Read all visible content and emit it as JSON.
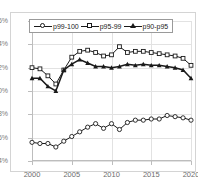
{
  "title": "",
  "chart_data": {
    "type": "line",
    "title": "",
    "xlabel": "",
    "ylabel": "",
    "xlim": [
      2000,
      2020
    ],
    "ylim": [
      4,
      16
    ],
    "ytick_labels": [
      "16%",
      "14%",
      "12%",
      "10%",
      "8%",
      "6%",
      "4%"
    ],
    "ytick_values": [
      16,
      14,
      12,
      10,
      8,
      6,
      4
    ],
    "xtick_labels": [
      "2000",
      "2005",
      "2010",
      "2015",
      "2020"
    ],
    "xtick_values": [
      2000,
      2005,
      2010,
      2015,
      2020
    ],
    "grid": true,
    "legend_position": "top-center",
    "value_suffix": "%",
    "x": [
      2000,
      2001,
      2002,
      2003,
      2004,
      2005,
      2006,
      2007,
      2008,
      2009,
      2010,
      2011,
      2012,
      2013,
      2014,
      2015,
      2016,
      2017,
      2018,
      2019,
      2020
    ],
    "series": [
      {
        "name": "p99-100",
        "marker": "open-circle",
        "values": [
          5.6,
          5.5,
          5.5,
          5.2,
          5.7,
          6.1,
          6.5,
          6.9,
          7.2,
          6.8,
          7.2,
          6.7,
          7.3,
          7.5,
          7.5,
          7.6,
          7.6,
          7.9,
          7.8,
          7.7,
          7.5
        ]
      },
      {
        "name": "p95-99",
        "marker": "open-square",
        "values": [
          12.0,
          11.9,
          11.3,
          10.6,
          11.8,
          12.9,
          13.4,
          13.5,
          13.3,
          13.0,
          13.1,
          13.8,
          13.3,
          13.4,
          13.4,
          13.3,
          13.2,
          13.1,
          13.0,
          12.8,
          12.2
        ]
      },
      {
        "name": "p90-p95",
        "marker": "filled-triangle",
        "values": [
          11.1,
          11.1,
          10.4,
          10.0,
          11.8,
          12.3,
          12.7,
          12.4,
          12.1,
          12.1,
          12.0,
          12.1,
          12.3,
          12.2,
          12.3,
          12.2,
          12.2,
          12.1,
          12.0,
          11.8,
          11.1
        ]
      }
    ]
  }
}
